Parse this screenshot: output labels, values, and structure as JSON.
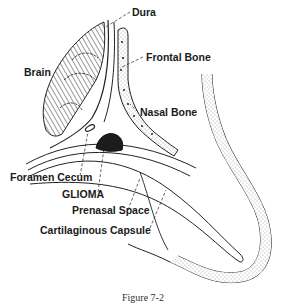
{
  "figure": {
    "caption": "Figure 7-2",
    "labels": {
      "dura": "Dura",
      "brain": "Brain",
      "frontal_bone": "Frontal Bone",
      "nasal_bone": "Nasal Bone",
      "foramen_cecum": "Foramen Cecum",
      "glioma": "GLIOMA",
      "prenasal_space": "Prenasal Space",
      "cartilaginous_capsule": "Cartilaginous Capsule"
    }
  }
}
